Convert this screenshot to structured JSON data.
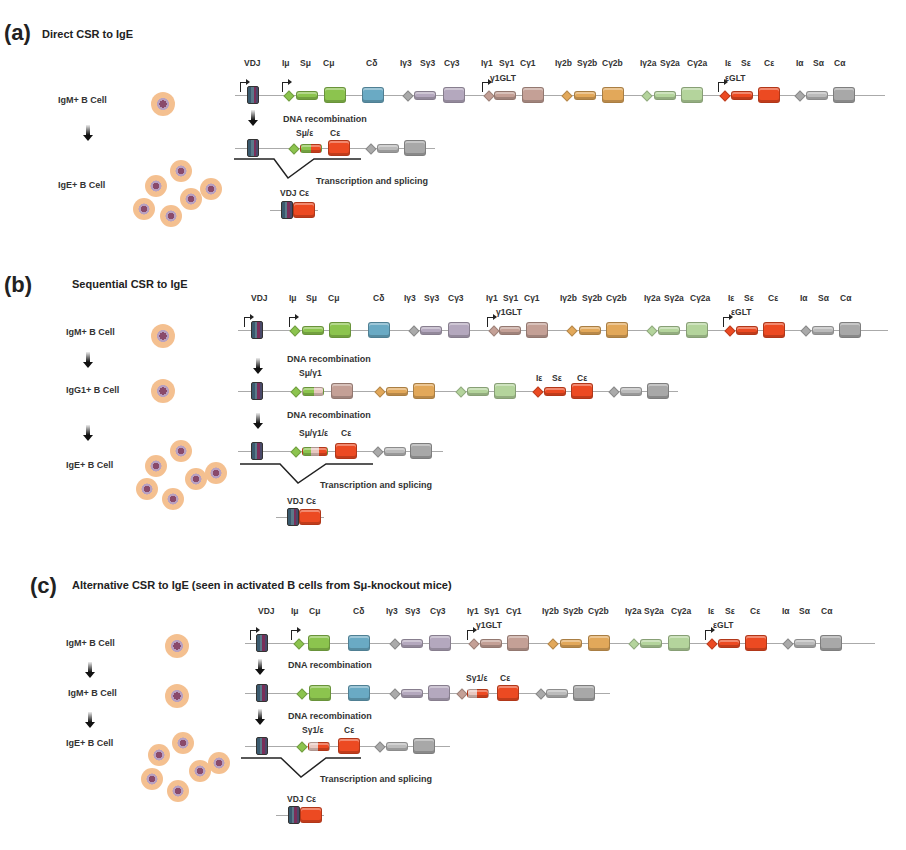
{
  "panels": [
    {
      "letter": "(a)",
      "title": "Direct CSR to IgE",
      "cells": [
        "IgM+ B Cell",
        "IgE+ B Cell"
      ],
      "steps": [
        "DNA recombination",
        "Transcription and splicing"
      ],
      "recomb_labels": [
        "Sμ/ε",
        "Cε"
      ],
      "product": "VDJ Cε"
    },
    {
      "letter": "(b)",
      "title": "Sequential CSR to IgE",
      "cells": [
        "IgM+ B Cell",
        "IgG1+ B Cell",
        "IgE+ B Cell"
      ],
      "steps": [
        "DNA recombination",
        "DNA recombination",
        "Transcription and splicing"
      ],
      "recomb_labels_1": [
        "Sμ/γ1",
        "Iε",
        "Sε",
        "Cε"
      ],
      "recomb_labels_2": [
        "Sμ/γ1/ε",
        "Cε"
      ],
      "product": "VDJ Cε"
    },
    {
      "letter": "(c)",
      "title": "Alternative CSR to IgE (seen in activated B cells from Sμ-knockout mice)",
      "cells": [
        "IgM+ B Cell",
        "IgM+ B Cell",
        "IgE+ B Cell"
      ],
      "steps": [
        "DNA recombination",
        "DNA recombination",
        "Transcription and splicing"
      ],
      "recomb_labels_1": [
        "Sγ1/ε",
        "Cε"
      ],
      "recomb_labels_2": [
        "Sγ1/ε",
        "Cε"
      ],
      "product": "VDJ Cε"
    }
  ],
  "locus_labels": [
    "VDJ",
    "Iμ",
    "Sμ",
    "Cμ",
    "Cδ",
    "Iγ3",
    "Sγ3",
    "Cγ3",
    "Iγ1",
    "Sγ1",
    "Cγ1",
    "Iγ2b",
    "Sγ2b",
    "Cγ2b",
    "Iγ2a",
    "Sγ2a",
    "Cγ2a",
    "Iε",
    "Sε",
    "Cε",
    "Iα",
    "Sα",
    "Cα"
  ],
  "locus_labels_c": [
    "VDJ",
    "Iμ",
    "Cμ",
    "Cδ",
    "Iγ3",
    "Sγ3",
    "Cγ3",
    "Iγ1",
    "Sγ1",
    "Cγ1",
    "Iγ2b",
    "Sγ2b",
    "Cγ2b",
    "Iγ2a",
    "Sγ2a",
    "Cγ2a",
    "Iε",
    "Sε",
    "Cε",
    "Iα",
    "Sα",
    "Cα"
  ],
  "glt": [
    "γ1GLT",
    "εGLT"
  ],
  "colors": {
    "mu": "#8cc44e",
    "delta": "#6aaac4",
    "g3": "#b4a8be",
    "g1": "#c4a096",
    "g2b": "#e2a85a",
    "g2a": "#b4d49c",
    "eps": "#ec4a22",
    "alpha": "#a8a8a8"
  }
}
